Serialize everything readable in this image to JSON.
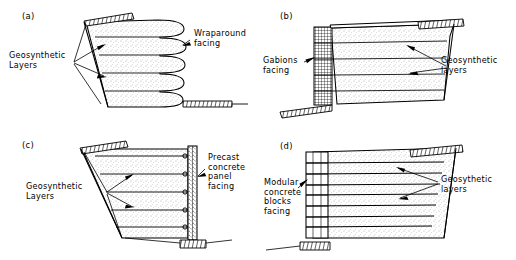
{
  "figure": {
    "type": "engineering-diagram",
    "panel_count": 4,
    "colors": {
      "ink": "#000000",
      "background": "#ffffff",
      "soil_fill": "#fdfdfd"
    }
  },
  "panels": [
    {
      "id": "a",
      "tag": "(a)",
      "facing_type": "wraparound",
      "labels": {
        "reinforcement": "Geosynthetic\nLayers",
        "facing": "Wraparound\nfacing"
      },
      "layer_count": 5,
      "leader_arrows": 2
    },
    {
      "id": "b",
      "tag": "(b)",
      "facing_type": "gabions",
      "labels": {
        "facing": "Gabions\nfacing",
        "reinforcement": "Geosynthetic\nlayers"
      },
      "layer_count": 5,
      "leader_arrows": 2
    },
    {
      "id": "c",
      "tag": "(c)",
      "facing_type": "precast-concrete-panel",
      "labels": {
        "reinforcement": "Geosynthetic\nLayers",
        "facing": "Precast\nconcrete\npanel\nfacing"
      },
      "layer_count": 5,
      "leader_arrows": 2
    },
    {
      "id": "d",
      "tag": "(d)",
      "facing_type": "modular-concrete-blocks",
      "labels": {
        "facing": "Modular\nconcrete\nblocks\nfacing",
        "reinforcement": "Geosythetic\nlayers"
      },
      "layer_count": 8,
      "leader_arrows": 2
    }
  ]
}
